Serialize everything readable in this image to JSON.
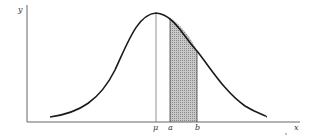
{
  "diagram": {
    "type": "normal-distribution-curve",
    "axes": {
      "y_label": "y",
      "x_label": "x"
    },
    "markers": {
      "mean_label": "μ",
      "a_label": "a",
      "b_label": "b"
    },
    "shaded_region": {
      "from": "a",
      "to": "b",
      "pattern": "stippled-gray"
    },
    "colors": {
      "line": "#1a1a1a",
      "axis": "#555555",
      "fill": "#b8b8b8"
    }
  }
}
